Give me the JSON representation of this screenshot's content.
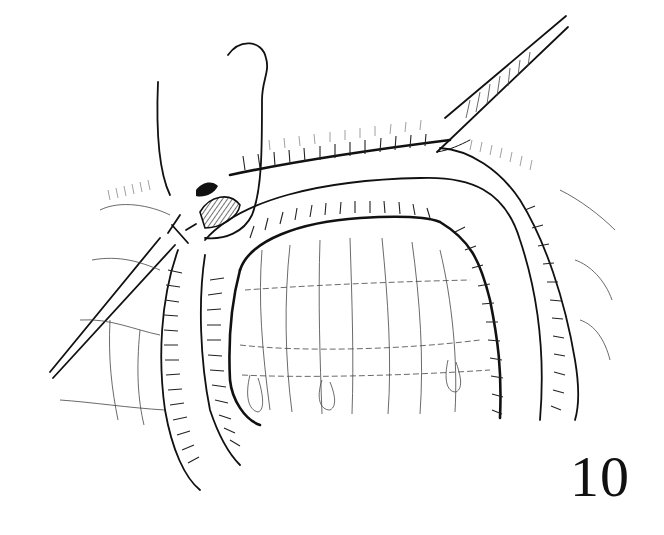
{
  "figure": {
    "kind": "surgical line illustration",
    "label": "10",
    "ink_color": "#111111",
    "background": "#ffffff"
  }
}
